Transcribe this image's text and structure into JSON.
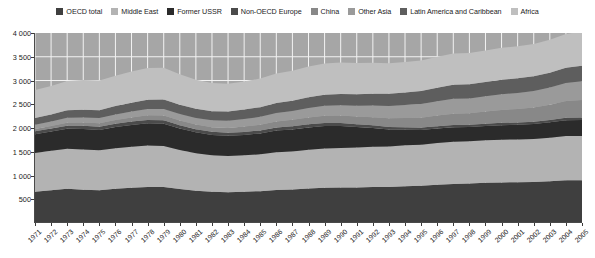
{
  "legend": {
    "position": "top",
    "items": [
      {
        "label": "OECD total",
        "color": "#3f3f3f"
      },
      {
        "label": "Middle East",
        "color": "#b3b3b3"
      },
      {
        "label": "Former USSR",
        "color": "#2b2b2b"
      },
      {
        "label": "Non-OECD Europe",
        "color": "#4b4b4b"
      },
      {
        "label": "China",
        "color": "#888888"
      },
      {
        "label": "Other Asia",
        "color": "#9a9a9a"
      },
      {
        "label": "Latin America and Caribbean",
        "color": "#5e5e5e"
      },
      {
        "label": "Africa",
        "color": "#bfbfbf"
      }
    ]
  },
  "axes": {
    "y_ticks": [
      "4 000",
      "3 500",
      "3 000",
      "2 500",
      "2 000",
      "1 500",
      "1 000",
      "500"
    ],
    "y_tick_values": [
      4000,
      3500,
      3000,
      2500,
      2000,
      1500,
      1000,
      500
    ],
    "ylim": [
      0,
      4000
    ],
    "x_ticks": [
      "1971",
      "1972",
      "1973",
      "1974",
      "1975",
      "1976",
      "1977",
      "1978",
      "1979",
      "1980",
      "1981",
      "1982",
      "1983",
      "1984",
      "1985",
      "1986",
      "1987",
      "1988",
      "1989",
      "1990",
      "1991",
      "1992",
      "1993",
      "1994",
      "1995",
      "1996",
      "1997",
      "1998",
      "1999",
      "2000",
      "2001",
      "2002",
      "2003",
      "2004",
      "2005"
    ]
  },
  "chart_data": {
    "type": "area",
    "title": "",
    "subtitle": "",
    "xlabel": "",
    "ylabel": "",
    "ylim": [
      0,
      4000
    ],
    "grid": true,
    "stacked": true,
    "legend_position": "top",
    "x": [
      1971,
      1972,
      1973,
      1974,
      1975,
      1976,
      1977,
      1978,
      1979,
      1980,
      1981,
      1982,
      1983,
      1984,
      1985,
      1986,
      1987,
      1988,
      1989,
      1990,
      1991,
      1992,
      1993,
      1994,
      1995,
      1996,
      1997,
      1998,
      1999,
      2000,
      2001,
      2002,
      2003,
      2004,
      2005
    ],
    "series": [
      {
        "name": "OECD total",
        "color": "#3f3f3f",
        "values": [
          660,
          690,
          720,
          700,
          690,
          720,
          740,
          760,
          760,
          715,
          680,
          660,
          650,
          660,
          670,
          695,
          705,
          725,
          740,
          745,
          750,
          760,
          760,
          775,
          785,
          805,
          820,
          830,
          845,
          855,
          860,
          865,
          880,
          900,
          900
        ]
      },
      {
        "name": "Middle East",
        "color": "#b3b3b3",
        "values": [
          815,
          830,
          845,
          850,
          840,
          855,
          865,
          870,
          860,
          820,
          790,
          765,
          760,
          765,
          775,
          795,
          800,
          815,
          830,
          835,
          840,
          845,
          850,
          860,
          865,
          880,
          890,
          890,
          895,
          900,
          900,
          905,
          915,
          930,
          930
        ]
      },
      {
        "name": "Former USSR",
        "color": "#2b2b2b",
        "values": [
          395,
          405,
          420,
          430,
          430,
          445,
          460,
          470,
          470,
          455,
          440,
          430,
          425,
          430,
          440,
          455,
          465,
          470,
          470,
          460,
          430,
          395,
          360,
          330,
          310,
          305,
          305,
          300,
          300,
          305,
          310,
          315,
          325,
          335,
          340
        ]
      },
      {
        "name": "Non-OECD Europe",
        "color": "#4b4b4b",
        "values": [
          60,
          62,
          65,
          66,
          66,
          68,
          70,
          71,
          71,
          68,
          66,
          64,
          63,
          63,
          64,
          65,
          66,
          67,
          67,
          66,
          60,
          56,
          52,
          50,
          49,
          49,
          49,
          48,
          48,
          48,
          48,
          48,
          49,
          50,
          50
        ]
      },
      {
        "name": "China",
        "color": "#888888",
        "values": [
          50,
          55,
          62,
          68,
          72,
          80,
          88,
          96,
          100,
          98,
          96,
          98,
          104,
          112,
          120,
          128,
          136,
          146,
          152,
          155,
          160,
          172,
          185,
          196,
          208,
          222,
          236,
          242,
          258,
          272,
          282,
          298,
          320,
          352,
          370
        ]
      },
      {
        "name": "Other Asia",
        "color": "#9a9a9a",
        "values": [
          90,
          96,
          104,
          108,
          110,
          118,
          126,
          134,
          140,
          140,
          140,
          144,
          150,
          158,
          166,
          176,
          186,
          198,
          210,
          220,
          230,
          244,
          258,
          272,
          288,
          302,
          316,
          312,
          320,
          330,
          338,
          348,
          362,
          380,
          392
        ]
      },
      {
        "name": "Latin America and Caribbean",
        "color": "#5e5e5e",
        "values": [
          140,
          148,
          158,
          164,
          168,
          176,
          184,
          192,
          198,
          196,
          194,
          194,
          196,
          200,
          204,
          212,
          218,
          226,
          232,
          236,
          242,
          250,
          258,
          266,
          274,
          284,
          294,
          298,
          300,
          306,
          308,
          310,
          314,
          324,
          330
        ]
      },
      {
        "name": "Africa",
        "color": "#bfbfbf",
        "values": [
          590,
          600,
          616,
          624,
          624,
          638,
          657,
          671,
          671,
          638,
          610,
          590,
          582,
          592,
          601,
          622,
          630,
          648,
          659,
          663,
          658,
          650,
          642,
          641,
          641,
          653,
          660,
          660,
          664,
          674,
          674,
          681,
          695,
          709,
          718
        ]
      }
    ]
  },
  "style": {
    "plot_background": "#a6a6a6",
    "gridline_color": "#f2f2f2",
    "axis_color": "#4a4a4a",
    "text_color": "#1b1b1b",
    "page_background": "#ffffff"
  }
}
